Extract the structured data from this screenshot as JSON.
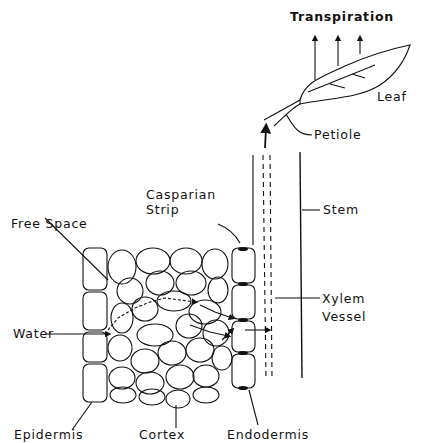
{
  "diagram": {
    "type": "plant water transport diagram",
    "labels": {
      "transpiration": "Transpiration",
      "leaf": "Leaf",
      "petiole": "Petiole",
      "casparian_line1": "Casparian",
      "casparian_line2": "Strip",
      "stem": "Stem",
      "free_space": "Free Space",
      "xylem_line1": "Xylem",
      "xylem_line2": "Vessel",
      "water": "Water",
      "epidermis": "Epidermis",
      "cortex": "Cortex",
      "endodermis": "Endodermis"
    },
    "colors": {
      "ink": "#111111",
      "background": "#ffffff"
    }
  }
}
